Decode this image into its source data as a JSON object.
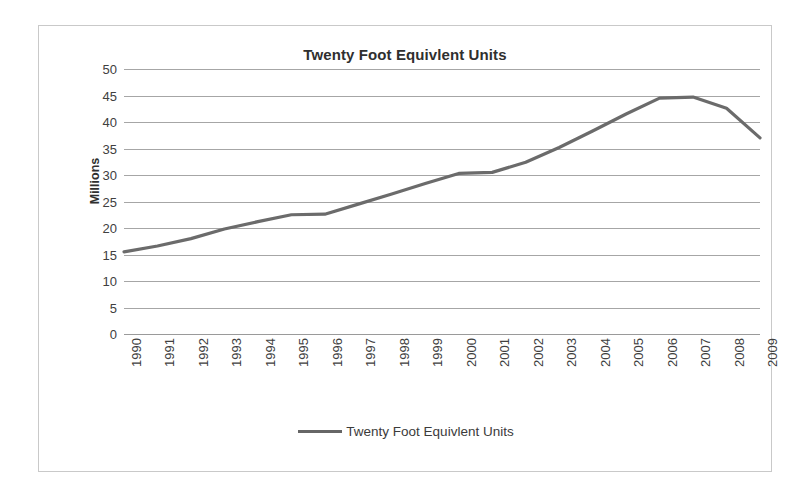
{
  "chart_data": {
    "type": "line",
    "title": "Twenty Foot Equivlent Units",
    "xlabel": "",
    "ylabel": "Millions",
    "ylim": [
      0,
      50
    ],
    "ytick_step": 5,
    "yticks": [
      50,
      45,
      40,
      35,
      30,
      25,
      20,
      15,
      10,
      5,
      0
    ],
    "grid": true,
    "legend_position": "bottom",
    "legend": [
      "Twenty Foot Equivlent Units"
    ],
    "series_color": "#6b6b6b",
    "categories": [
      "1990",
      "1991",
      "1992",
      "1993",
      "1994",
      "1995",
      "1996",
      "1997",
      "1998",
      "1999",
      "2000",
      "2001",
      "2002",
      "2003",
      "2004",
      "2005",
      "2006",
      "2007",
      "2008",
      "2009"
    ],
    "series": [
      {
        "name": "Twenty Foot Equivlent Units",
        "values": [
          15.5,
          16.6,
          18.0,
          19.8,
          21.2,
          22.5,
          22.6,
          24.5,
          26.4,
          28.4,
          30.3,
          30.5,
          32.4,
          35.2,
          38.3,
          41.5,
          44.5,
          44.7,
          42.6,
          37.0
        ]
      }
    ]
  },
  "chart": {
    "title": "Twenty Foot Equivlent Units",
    "y_axis_title": "Millions",
    "legend_label": "Twenty Foot Equivlent Units"
  }
}
